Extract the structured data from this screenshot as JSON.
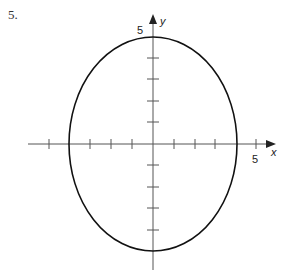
{
  "problem_number": "5.",
  "graph": {
    "x_axis_label": "x",
    "y_axis_label": "y",
    "x_tick_label": "5",
    "y_tick_label": "5",
    "ellipse": {
      "center": [
        0,
        0
      ],
      "semi_axis_x": 4,
      "semi_axis_y": 5,
      "equation": "x^2/16 + y^2/25 = 1"
    },
    "x_range": [
      -6,
      6
    ],
    "y_range": [
      -6,
      6
    ],
    "tick_spacing": 1,
    "colors": {
      "axis": "#555555",
      "curve": "#111111"
    }
  }
}
